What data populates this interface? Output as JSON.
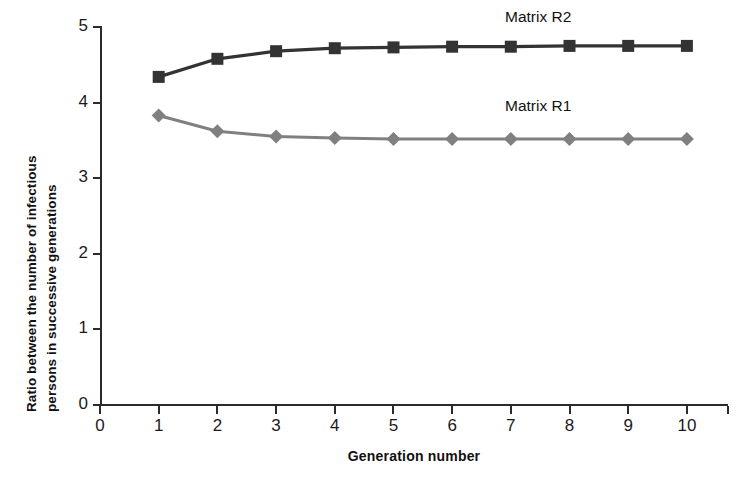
{
  "chart_data": {
    "type": "line",
    "title": "",
    "xlabel": "Generation number",
    "ylabel": "Ratio between the number of infectious persons in successive generations",
    "ylabel_line1": "Ratio between the number of infectious",
    "ylabel_line2": "persons in successive generations",
    "x": [
      1,
      2,
      3,
      4,
      5,
      6,
      7,
      8,
      9,
      10
    ],
    "xlim": [
      0,
      10.7
    ],
    "ylim": [
      0,
      5
    ],
    "xticks": [
      0,
      1,
      2,
      3,
      4,
      5,
      6,
      7,
      8,
      9,
      10
    ],
    "xtick_labels": [
      "0",
      "1",
      "2",
      "3",
      "4",
      "5",
      "6",
      "7",
      "8",
      "9",
      "10"
    ],
    "yticks": [
      0,
      1,
      2,
      3,
      4,
      5
    ],
    "ytick_labels": [
      "0",
      "1",
      "2",
      "3",
      "4",
      "5"
    ],
    "grid": false,
    "legend_position": "inline-annotation",
    "series": [
      {
        "name": "Matrix R2",
        "label": "Matrix R2",
        "color": "#333333",
        "marker": "square",
        "values": [
          4.34,
          4.58,
          4.68,
          4.72,
          4.73,
          4.74,
          4.74,
          4.75,
          4.75,
          4.75
        ]
      },
      {
        "name": "Matrix R1",
        "label": "Matrix R1",
        "color": "#808080",
        "marker": "diamond",
        "values": [
          3.83,
          3.62,
          3.55,
          3.53,
          3.52,
          3.52,
          3.52,
          3.52,
          3.52,
          3.52
        ]
      }
    ]
  },
  "axis": {
    "line_color": "#2b2b2b"
  }
}
